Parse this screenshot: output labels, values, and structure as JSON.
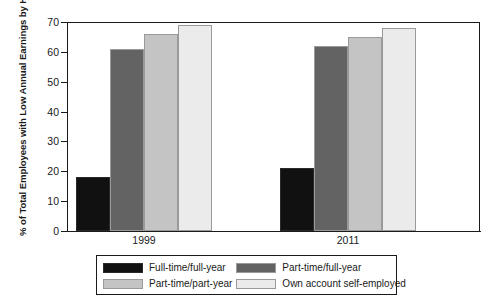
{
  "chart_data": {
    "type": "bar",
    "title": "",
    "xlabel": "",
    "ylabel": "% of Total Employees with Low Annual Earnings by Hours and Weeks of Work",
    "ylim": [
      0,
      70
    ],
    "yticks": [
      0,
      10,
      20,
      30,
      40,
      50,
      60,
      70
    ],
    "ytick_labels": [
      "0",
      "10",
      "20",
      "30",
      "40",
      "50",
      "60",
      "70"
    ],
    "grid": false,
    "legend_position": "bottom",
    "categories": [
      "1999",
      "2011"
    ],
    "series": [
      {
        "name": "Full-time/full-year",
        "color": "#111111",
        "values": [
          18,
          21
        ]
      },
      {
        "name": "Part-time/full-year",
        "color": "#636363",
        "values": [
          61,
          62
        ]
      },
      {
        "name": "Part-time/part-year",
        "color": "#c4c4c4",
        "values": [
          66,
          65
        ]
      },
      {
        "name": "Own account self-employed",
        "color": "#ebebeb",
        "values": [
          69,
          68
        ]
      }
    ]
  },
  "axes": {
    "y_title": "% of Total Employees with Low Annual Earnings by Hours and Weeks of Work"
  },
  "colors": {
    "axis": "#1a1a1a",
    "background": "#ffffff",
    "bar_edge": "#9a9a9a"
  }
}
